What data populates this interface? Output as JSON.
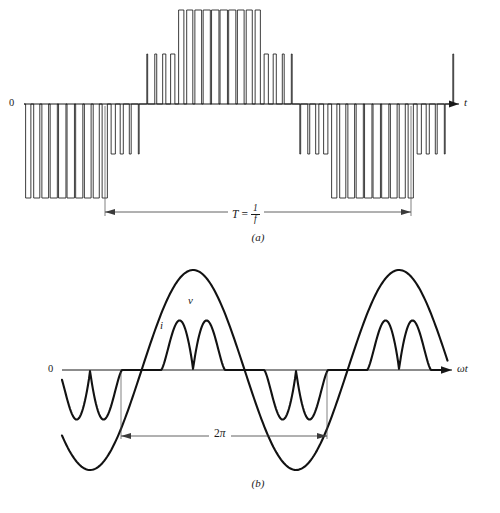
{
  "figure": {
    "background_color": "#ffffff",
    "ink_color": "#1a1a1a"
  },
  "panel_a": {
    "caption": "(a)",
    "origin_label": "0",
    "axis_label": "t",
    "dimension": {
      "symbol": "T",
      "equals": "=",
      "numerator": "1",
      "denominator": "f",
      "text": "T = 1/f"
    }
  },
  "panel_b": {
    "caption": "(b)",
    "origin_label": "0",
    "axis_label": "ωt",
    "curve_labels": {
      "voltage": "v",
      "current": "i"
    },
    "dimension": {
      "text": "2π",
      "coefficient": "2",
      "symbol": "π"
    }
  },
  "chart_data": {
    "type": "line",
    "panels": [
      {
        "id": "a",
        "label": "(a)",
        "xlabel": "t",
        "ylabel": "",
        "ylim": [
          -1.15,
          1.15
        ],
        "xlim": [
          0,
          1
        ],
        "grid": false,
        "legend": "none",
        "series": [
          {
            "name": "pwm-output-voltage",
            "type": "pwm",
            "description": "Sinusoidal pulse-width-modulated square wave; pulse widths follow a sine envelope over one period T",
            "carrier_pulses_per_period": 36,
            "modulation_index": 0.92,
            "amplitude_levels": [
              0.42,
              0.78
            ],
            "phase_offset_fraction": -0.11
          }
        ],
        "annotations": [
          {
            "name": "period-dimension",
            "text": "T = 1/f",
            "x_start_fraction": 0.228,
            "x_end_fraction": 0.845,
            "value": "one full period"
          }
        ]
      },
      {
        "id": "b",
        "label": "(b)",
        "xlabel": "ωt",
        "ylabel": "",
        "ylim": [
          -1.15,
          1.15
        ],
        "xlim": [
          0,
          1
        ],
        "grid": false,
        "legend": "inline",
        "series": [
          {
            "name": "voltage",
            "label": "v",
            "type": "sine",
            "amplitude": 1.0,
            "cycles": 2.0,
            "phase_fraction": -0.1,
            "description": "Smooth sinusoidal voltage, two cycles shown"
          },
          {
            "name": "current",
            "label": "i",
            "type": "distorted",
            "amplitude": 0.52,
            "cycles": 2.0,
            "phase_fraction": -0.1,
            "humps_per_half_cycle": 2,
            "conduction_angle_fraction": 0.62,
            "description": "Discontinuous double-humped current drawn by a capacitor-input rectifier load; zero between conduction intervals"
          }
        ],
        "annotations": [
          {
            "name": "cycle-dimension",
            "text": "2π",
            "x_start_fraction": 0.242,
            "x_end_fraction": 0.654,
            "value": "one full cycle in radians"
          }
        ]
      }
    ]
  }
}
